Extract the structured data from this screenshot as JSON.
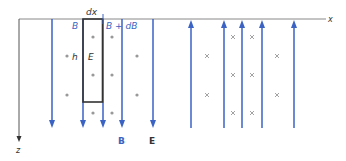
{
  "labels": {
    "dx": "dx",
    "B_left": "B",
    "B_plus_dB": "B + dB",
    "h": "h",
    "E_in_loop": "E",
    "legend_B": "B",
    "legend_E": "E",
    "axis_x": "x",
    "axis_z": "z"
  },
  "colors": {
    "field_line": "#3a63c4",
    "axis": "#777777",
    "loop": "#333333",
    "marker": "#999999",
    "label_blue": "#3a63c4",
    "label_dark": "#333333"
  },
  "field_lines_down_x": [
    52,
    83,
    103,
    122,
    153
  ],
  "field_lines_up_x": [
    191,
    224,
    242,
    262,
    294
  ],
  "dots": [
    [
      67,
      56
    ],
    [
      67,
      95
    ],
    [
      93,
      37
    ],
    [
      93,
      75
    ],
    [
      93,
      113
    ],
    [
      112,
      37
    ],
    [
      112,
      75
    ],
    [
      112,
      113
    ],
    [
      137,
      56
    ],
    [
      137,
      95
    ]
  ],
  "crosses": [
    [
      207,
      56
    ],
    [
      207,
      95
    ],
    [
      233,
      37
    ],
    [
      233,
      75
    ],
    [
      233,
      113
    ],
    [
      252,
      37
    ],
    [
      252,
      75
    ],
    [
      252,
      113
    ],
    [
      277,
      56
    ],
    [
      277,
      95
    ]
  ]
}
